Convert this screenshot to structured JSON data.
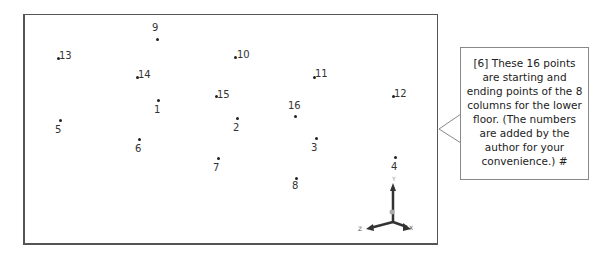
{
  "viewport": {
    "points": [
      {
        "label": "1",
        "x": 156,
        "y": 99,
        "lx": 152,
        "ly": 104
      },
      {
        "label": "2",
        "x": 235,
        "y": 117,
        "lx": 231,
        "ly": 122
      },
      {
        "label": "3",
        "x": 314,
        "y": 137,
        "lx": 309,
        "ly": 142
      },
      {
        "label": "4",
        "x": 393,
        "y": 156,
        "lx": 389,
        "ly": 161
      },
      {
        "label": "5",
        "x": 58,
        "y": 119,
        "lx": 53,
        "ly": 124
      },
      {
        "label": "6",
        "x": 137,
        "y": 138,
        "lx": 133,
        "ly": 143
      },
      {
        "label": "7",
        "x": 216,
        "y": 157,
        "lx": 211,
        "ly": 162
      },
      {
        "label": "8",
        "x": 294,
        "y": 177,
        "lx": 290,
        "ly": 180
      },
      {
        "label": "9",
        "x": 155,
        "y": 38,
        "lx": 150,
        "ly": 22
      },
      {
        "label": "10",
        "x": 233,
        "y": 56,
        "lx": 235,
        "ly": 49
      },
      {
        "label": "11",
        "x": 312,
        "y": 76,
        "lx": 313,
        "ly": 68
      },
      {
        "label": "12",
        "x": 391,
        "y": 95,
        "lx": 392,
        "ly": 88
      },
      {
        "label": "13",
        "x": 56,
        "y": 57,
        "lx": 57,
        "ly": 50
      },
      {
        "label": "14",
        "x": 135,
        "y": 76,
        "lx": 136,
        "ly": 69
      },
      {
        "label": "15",
        "x": 214,
        "y": 95,
        "lx": 215,
        "ly": 89
      },
      {
        "label": "16",
        "x": 293,
        "y": 115,
        "lx": 286,
        "ly": 100
      }
    ],
    "axes": {
      "x": "X",
      "y": "Y",
      "z": "Z"
    }
  },
  "callout": {
    "text": "[6] These 16 points are starting and ending points of the 8 columns for the lower floor.  (The numbers are added by the author for your convenience.)  #"
  }
}
